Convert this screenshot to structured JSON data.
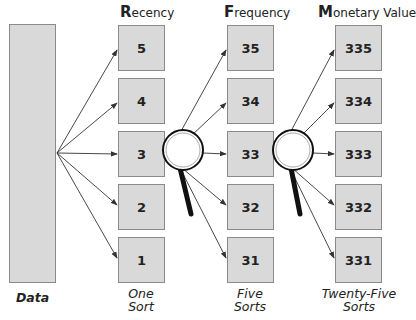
{
  "columns": [
    {
      "initial": "R",
      "rest": "ecency",
      "footer": "One Sort",
      "boxes": [
        "5",
        "4",
        "3",
        "2",
        "1"
      ]
    },
    {
      "initial": "F",
      "rest": "requency",
      "footer": "Five Sorts",
      "boxes": [
        "35",
        "34",
        "33",
        "32",
        "31"
      ]
    },
    {
      "initial": "M",
      "rest": "onetary Value",
      "footer": "Twenty-Five Sorts",
      "boxes": [
        "335",
        "334",
        "333",
        "332",
        "331"
      ]
    }
  ],
  "footer_lines": {
    "col0": [
      "One",
      "Sort"
    ],
    "col1": [
      "Five",
      "Sorts"
    ],
    "col2": [
      "Twenty-Five",
      "Sorts"
    ]
  },
  "data_label": "Data",
  "colors": {
    "box_fill": "#d9d9d9",
    "box_border": "#8a8a8a",
    "line": "#333333",
    "handle": "#111111"
  }
}
